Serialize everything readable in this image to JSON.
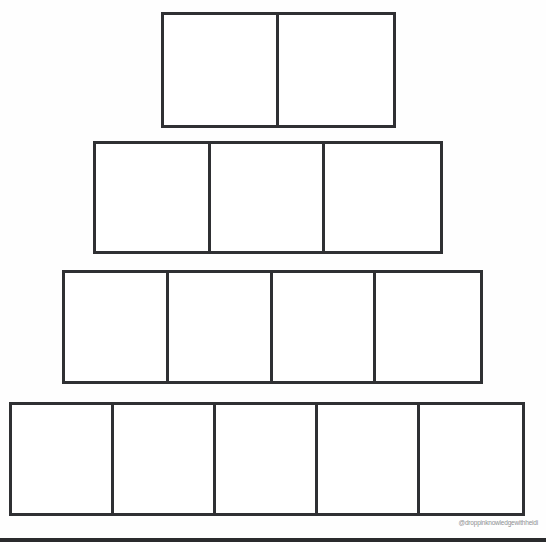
{
  "document": {
    "type": "blank-pyramid-graphic-organizer",
    "title": "Blank Pyramid Worksheet",
    "background_color": "#ffffff",
    "line_color": "#2f3033"
  },
  "pyramid": {
    "tier_count": 4,
    "tiers": [
      {
        "index": 1,
        "position": "top",
        "cell_count": 2,
        "cells": [
          {
            "index": 1,
            "text": ""
          },
          {
            "index": 2,
            "text": ""
          }
        ]
      },
      {
        "index": 2,
        "position": "upper-middle",
        "cell_count": 3,
        "cells": [
          {
            "index": 1,
            "text": ""
          },
          {
            "index": 2,
            "text": ""
          },
          {
            "index": 3,
            "text": ""
          }
        ]
      },
      {
        "index": 3,
        "position": "lower-middle",
        "cell_count": 4,
        "cells": [
          {
            "index": 1,
            "text": ""
          },
          {
            "index": 2,
            "text": ""
          },
          {
            "index": 3,
            "text": ""
          },
          {
            "index": 4,
            "text": ""
          }
        ]
      },
      {
        "index": 4,
        "position": "bottom",
        "cell_count": 5,
        "cells": [
          {
            "index": 1,
            "text": ""
          },
          {
            "index": 2,
            "text": ""
          },
          {
            "index": 3,
            "text": ""
          },
          {
            "index": 4,
            "text": ""
          },
          {
            "index": 5,
            "text": ""
          }
        ]
      }
    ]
  },
  "watermark": {
    "handle": "@droppinknowledgewithheidi",
    "color": "#8d8f92"
  }
}
